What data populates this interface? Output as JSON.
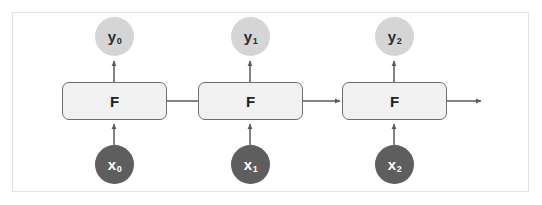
{
  "diagram": {
    "type": "rnn-unrolled-diagram",
    "colors": {
      "background": "#ffffff",
      "frame_border": "#e2e2e2",
      "cell_fill": "#f1f1f1",
      "cell_border": "#6e6e6e",
      "output_node_fill": "#d5d5d5",
      "output_node_text": "#2b2b2b",
      "input_node_fill": "#5e5e5e",
      "input_node_text": "#ffffff",
      "arrow": "#5a5a5a"
    },
    "timesteps": [
      {
        "index": 0,
        "input": {
          "symbol": "x",
          "subscript": "0"
        },
        "cell": {
          "label": "F"
        },
        "output": {
          "symbol": "y",
          "subscript": "0"
        }
      },
      {
        "index": 1,
        "input": {
          "symbol": "x",
          "subscript": "1"
        },
        "cell": {
          "label": "F"
        },
        "output": {
          "symbol": "y",
          "subscript": "1"
        }
      },
      {
        "index": 2,
        "input": {
          "symbol": "x",
          "subscript": "2"
        },
        "cell": {
          "label": "F"
        },
        "output": {
          "symbol": "y",
          "subscript": "2"
        }
      }
    ],
    "connections": {
      "input_to_cell": "upward-arrow",
      "cell_to_output": "upward-arrow",
      "cell_to_cell": "rightward-arrow",
      "trailing_state": "rightward-arrow"
    }
  }
}
